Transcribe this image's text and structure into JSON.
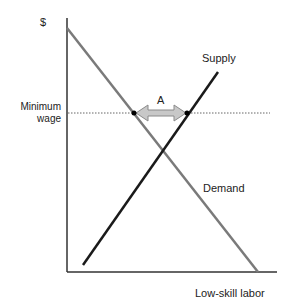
{
  "diagram": {
    "y_axis_label": "$",
    "x_axis_label": "Low-skill labor",
    "min_wage_label_line1": "Minimum",
    "min_wage_label_line2": "wage",
    "supply_label": "Supply",
    "demand_label": "Demand",
    "gap_label": "A",
    "colors": {
      "axis": "#333333",
      "demand": "#7a7a7a",
      "supply": "#1a1a1a",
      "min_wage_line": "#666666",
      "arrow_fill": "#c8c8c8",
      "arrow_stroke": "#8a8a8a"
    }
  }
}
